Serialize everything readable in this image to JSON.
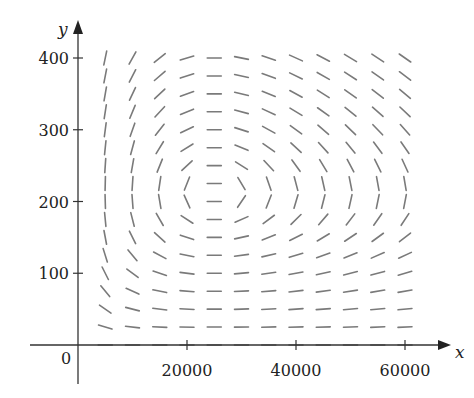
{
  "chart_data": {
    "type": "direction_field",
    "title": "",
    "xlabel": "x",
    "ylabel": "y",
    "xlim": [
      0,
      63000
    ],
    "ylim": [
      0,
      420
    ],
    "x_ticks": [
      20000,
      40000,
      60000
    ],
    "x_tick_labels": [
      "20000",
      "40000",
      "60000"
    ],
    "y_ticks": [
      100,
      200,
      300,
      400
    ],
    "y_tick_labels": [
      "100",
      "200",
      "300",
      "400"
    ],
    "origin_label": "0",
    "grid": false,
    "legend": null,
    "field": {
      "equation": "dy/dx = y(-c + d*x) / (x(a - b*y))",
      "a": 0.1,
      "b": 0.000470588,
      "c": 0.05,
      "d": 2e-06,
      "equilibrium": [
        25000,
        212.5
      ],
      "x_samples": [
        5000,
        10000,
        15000,
        20000,
        25000,
        30000,
        35000,
        40000,
        45000,
        50000,
        55000,
        60000
      ],
      "y_samples": [
        0,
        25,
        50,
        75,
        100,
        125,
        150,
        175,
        200,
        225,
        250,
        275,
        300,
        325,
        350,
        375,
        400
      ],
      "segment_length_px": 14
    },
    "colors": {
      "axis": "#333333",
      "segment": "#7a7a7a",
      "text": "#222222"
    }
  }
}
